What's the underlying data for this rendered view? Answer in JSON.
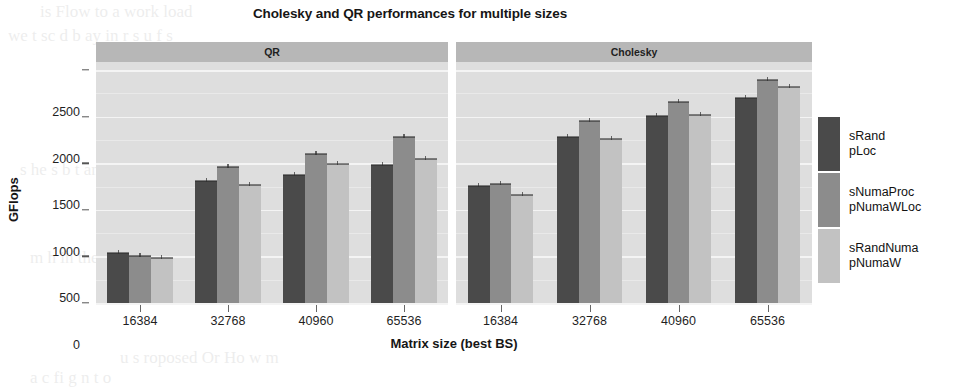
{
  "chart_data": {
    "type": "bar",
    "title": "Cholesky and QR performances for multiple sizes",
    "xlabel": "Matrix size (best BS)",
    "ylabel": "GFlops",
    "ylim": [
      0,
      2650
    ],
    "yticks": [
      0,
      500,
      1000,
      1500,
      2000,
      2500
    ],
    "ytick_labels": [
      "0",
      "500",
      "1000",
      "1500",
      "2000",
      "2500"
    ],
    "grid": true,
    "legend_position": "right",
    "grouping": "grouped-by-matrix-size",
    "panels": [
      {
        "label": "QR",
        "categories": [
          "16384",
          "32768",
          "40960",
          "65536"
        ],
        "series": [
          {
            "name": "sRand pLoc",
            "values": [
              540,
              1310,
              1370,
              1480
            ]
          },
          {
            "name": "sNumaProc pNumaWLoc",
            "values": [
              505,
              1460,
              1600,
              1780
            ]
          },
          {
            "name": "sRandNuma pNumaW",
            "values": [
              480,
              1270,
              1495,
              1545
            ]
          }
        ]
      },
      {
        "label": "Cholesky",
        "categories": [
          "16384",
          "32768",
          "40960",
          "65536"
        ],
        "series": [
          {
            "name": "sRand pLoc",
            "values": [
              1255,
              1780,
              2010,
              2200
            ]
          },
          {
            "name": "sNumaProc pNumaWLoc",
            "values": [
              1280,
              1950,
              2155,
              2390
            ]
          },
          {
            "name": "sRandNuma pNumaW",
            "values": [
              1160,
              1755,
              2020,
              2320
            ]
          }
        ]
      }
    ],
    "legend": [
      {
        "line1": "sRand",
        "line2": "pLoc",
        "color": "#4a4a4a"
      },
      {
        "line1": "sNumaProc",
        "line2": "pNumaWLoc",
        "color": "#8c8c8c"
      },
      {
        "line1": "sRandNuma",
        "line2": "pNumaW",
        "color": "#c2c2c2"
      }
    ],
    "colors": {
      "series1": "#4a4a4a",
      "series2": "#8c8c8c",
      "series3": "#c2c2c2",
      "panel_background": "#dedede",
      "strip_background": "#b7b7b7",
      "gridline": "#f4f4f4",
      "text": "#1a1a1a"
    }
  },
  "page_ghost": [
    "is Flow   to   a work load",
    "we    t    sc d    b    ay   in r   s    u    f    s",
    "of  both of  the  figure  we show  statistic",
    "the        t    the    I        r    i",
    "s  he       s    b   t  an",
    "y     is         of       no   a   o",
    "m      h      in   the",
    "u            s  roposed      Or   Ho   w   m",
    "a      c      fi    g    n    t    o"
  ]
}
